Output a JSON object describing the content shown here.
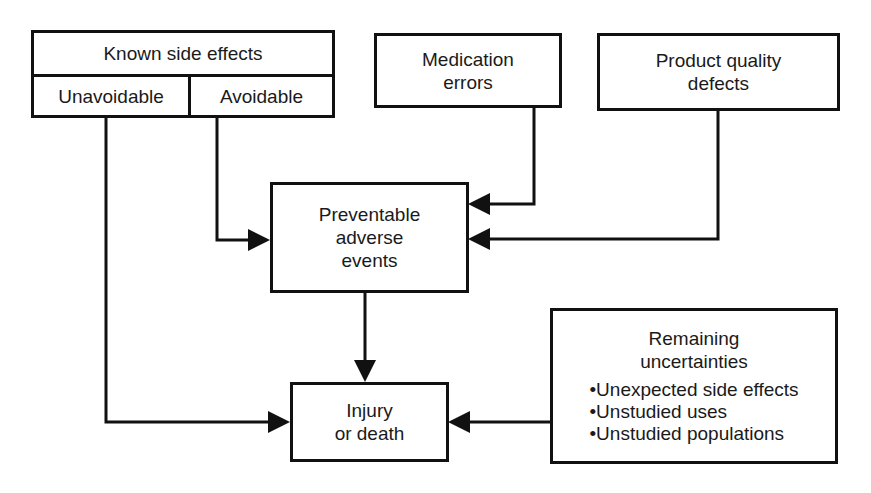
{
  "nodes": {
    "known_side_effects": {
      "title": "Known side effects",
      "left": "Unavoidable",
      "right": "Avoidable"
    },
    "medication_errors": {
      "line1": "Medication",
      "line2": "errors"
    },
    "product_quality_defects": {
      "line1": "Product quality",
      "line2": "defects"
    },
    "preventable_adverse_events": {
      "line1": "Preventable",
      "line2": "adverse",
      "line3": "events"
    },
    "injury_or_death": {
      "line1": "Injury",
      "line2": "or death"
    },
    "remaining_uncertainties": {
      "line1": "Remaining",
      "line2": "uncertainties",
      "items": [
        "Unexpected side effects",
        "Unstudied uses",
        "Unstudied populations"
      ]
    }
  },
  "edges": [
    {
      "from": "Unavoidable",
      "to": "Injury or death"
    },
    {
      "from": "Avoidable",
      "to": "Preventable adverse events"
    },
    {
      "from": "Medication errors",
      "to": "Preventable adverse events"
    },
    {
      "from": "Product quality defects",
      "to": "Preventable adverse events"
    },
    {
      "from": "Preventable adverse events",
      "to": "Injury or death"
    },
    {
      "from": "Remaining uncertainties",
      "to": "Injury or death"
    }
  ],
  "colors": {
    "stroke": "#111111",
    "text": "#1a1a1a",
    "background": "#ffffff"
  }
}
